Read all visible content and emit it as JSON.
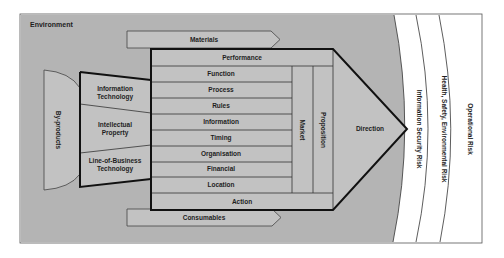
{
  "diagram": {
    "environment_label": "Environment",
    "inputs": {
      "materials": "Materials",
      "consumables": "Consumables"
    },
    "outputs": {
      "by_products": "By-products"
    },
    "left_block": [
      {
        "line1": "Information",
        "line2": "Technology"
      },
      {
        "line1": "Intellectual",
        "line2": "Property"
      },
      {
        "line1": "Line-of-Business",
        "line2": "Technology"
      }
    ],
    "rows": [
      "Performance",
      "Function",
      "Process",
      "Rules",
      "Information",
      "Timing",
      "Organisation",
      "Financial",
      "Location",
      "Action"
    ],
    "columns": [
      "Market",
      "Proposition"
    ],
    "arrow_label": "Direction",
    "risk_bands": [
      "Information Security Risk",
      "Health, Safety, Environmental Risk",
      "Operational Risk"
    ],
    "colors": {
      "environment_fill": "#b4b4b4",
      "box_fill": "#c2c2c2",
      "outline": "#111111",
      "band_fill": "#ffffff"
    }
  }
}
